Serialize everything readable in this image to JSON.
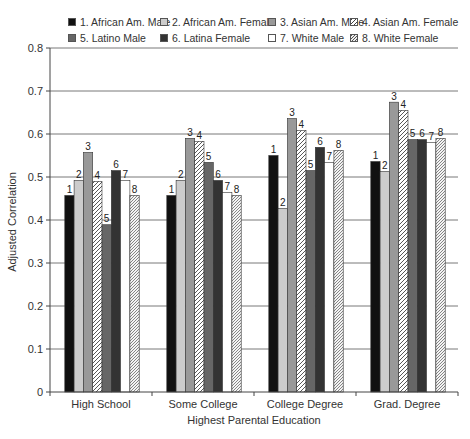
{
  "chart_data": {
    "type": "bar",
    "title": "",
    "xlabel": "Highest Parental Education",
    "ylabel": "Adjusted Correlation",
    "ylim": [
      0,
      0.8
    ],
    "yticks": [
      "0",
      "0.1",
      "0.2",
      "0.3",
      "0.4",
      "0.5",
      "0.6",
      "0.7",
      "0.8"
    ],
    "grid": "horizontal",
    "legend_position": "top",
    "categories": [
      "High School",
      "Some College",
      "College Degree",
      "Grad. Degree"
    ],
    "series": [
      {
        "name": "1. African Am. Male",
        "label": "1",
        "fill": "#111111",
        "pattern": "solid",
        "values": [
          0.457,
          0.457,
          0.55,
          0.536
        ]
      },
      {
        "name": "2. African Am. Female",
        "label": "2",
        "fill": "#cccccc",
        "pattern": "solid",
        "values": [
          0.492,
          0.492,
          0.427,
          0.513
        ]
      },
      {
        "name": "3. Asian Am. Male",
        "label": "3",
        "fill": "#999999",
        "pattern": "solid",
        "values": [
          0.557,
          0.59,
          0.636,
          0.674
        ]
      },
      {
        "name": "4. Asian Am. Female",
        "label": "4",
        "fill": "#ffffff",
        "pattern": "hatch",
        "values": [
          0.49,
          0.583,
          0.608,
          0.655
        ]
      },
      {
        "name": "5. Latino Male",
        "label": "5",
        "fill": "#666666",
        "pattern": "solid",
        "values": [
          0.389,
          0.534,
          0.515,
          0.587
        ]
      },
      {
        "name": "6. Latina Female",
        "label": "6",
        "fill": "#333333",
        "pattern": "solid",
        "values": [
          0.515,
          0.492,
          0.569,
          0.587
        ]
      },
      {
        "name": "7. White Male",
        "label": "7",
        "fill": "#ffffff",
        "pattern": "solid",
        "values": [
          0.492,
          0.464,
          0.534,
          0.58
        ]
      },
      {
        "name": "8. White Female",
        "label": "8",
        "fill": "#ffffff",
        "pattern": "hatch-dense",
        "values": [
          0.457,
          0.457,
          0.562,
          0.59
        ]
      }
    ]
  },
  "legend": {
    "items": [
      {
        "label": "1. African Am. Male",
        "x": 68,
        "y": 16
      },
      {
        "label": "2. African Am. Female",
        "x": 160,
        "y": 16
      },
      {
        "label": "3. Asian Am. Male",
        "x": 268,
        "y": 16
      },
      {
        "label": "4. Asian Am. Female",
        "x": 350,
        "y": 16
      },
      {
        "label": "5. Latino Male",
        "x": 68,
        "y": 32
      },
      {
        "label": "6. Latina Female",
        "x": 160,
        "y": 32
      },
      {
        "label": "7. White Male",
        "x": 268,
        "y": 32
      },
      {
        "label": "8. White Female",
        "x": 350,
        "y": 32
      }
    ]
  },
  "axes": {
    "y_title": "Adjusted Correlation",
    "x_title": "Highest Parental Education"
  }
}
